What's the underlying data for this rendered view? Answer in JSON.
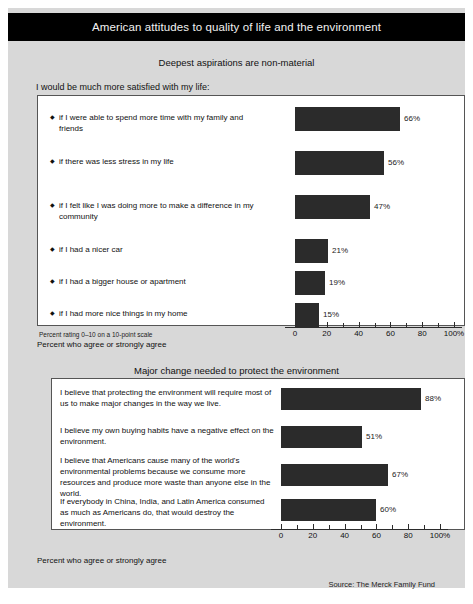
{
  "header": {
    "title": "American attitudes to quality of life and the environment",
    "background": "#000000",
    "text_color": "#ffffff"
  },
  "chart_data": [
    {
      "type": "bar",
      "orientation": "horizontal",
      "title": "Deepest aspirations are non-material",
      "lead_in": "I would be much more satisfied with my life:",
      "categories": [
        "if I were able to spend more time with my family and friends",
        "if there was less stress in my life",
        "if I felt like I was doing more to make a difference in my community",
        "if I had a nicer car",
        "if I had a bigger house or apartment",
        "if I had more nice things in my home"
      ],
      "values": [
        66,
        56,
        47,
        21,
        19,
        15
      ],
      "value_labels": [
        "66%",
        "56%",
        "47%",
        "21%",
        "19%",
        "15%"
      ],
      "xlabel": "",
      "ylabel": "",
      "xlim": [
        0,
        100
      ],
      "xticks": [
        0,
        20,
        40,
        60,
        80,
        100
      ],
      "xtick_labels": [
        "0",
        "20",
        "40",
        "60",
        "80",
        "100%"
      ],
      "minor_ticks": [
        10,
        30,
        50,
        70,
        90
      ],
      "grid": false,
      "legend": "none",
      "bar_color": "#2b2b2b",
      "footnotes": [
        "Percent rating 0–10 on a 10-point scale",
        "Percent who agree or strongly agree"
      ]
    },
    {
      "type": "bar",
      "orientation": "horizontal",
      "title": "Major change needed to protect the environment",
      "lead_in": "",
      "categories": [
        "I believe that protecting the environment will require most of us to make major changes in the way we live.",
        "I believe my own buying habits have a negative effect on the environment.",
        "I believe that Americans cause many of the world's environmental problems because we consume more resources and produce more waste than anyone else in the world.",
        "If everybody in China, India, and Latin America consumed as much as Americans do, that would destroy the environment."
      ],
      "values": [
        88,
        51,
        67,
        60
      ],
      "value_labels": [
        "88%",
        "51%",
        "67%",
        "60%"
      ],
      "xlabel": "",
      "ylabel": "",
      "xlim": [
        0,
        100
      ],
      "xticks": [
        0,
        20,
        40,
        60,
        80,
        100
      ],
      "xtick_labels": [
        "0",
        "20",
        "40",
        "60",
        "80",
        "100%"
      ],
      "minor_ticks": [
        10,
        30,
        50,
        70,
        90
      ],
      "grid": false,
      "legend": "none",
      "bar_color": "#2b2b2b",
      "footnotes": [
        "Percent who agree or strongly agree"
      ]
    }
  ],
  "source": "Source: The Merck Family Fund"
}
